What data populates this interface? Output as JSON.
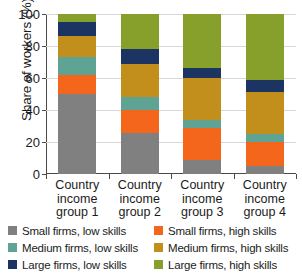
{
  "chart_data": {
    "type": "bar",
    "stacked": true,
    "title": "",
    "xlabel": "",
    "ylabel": "Share of workers (%)",
    "ylim": [
      0,
      100
    ],
    "yticks": [
      0,
      20,
      40,
      60,
      80,
      100
    ],
    "ytick_labels": [
      "0",
      "20",
      "40",
      "60",
      "80",
      "100"
    ],
    "grid": true,
    "legend_position": "bottom",
    "categories": [
      "Country income group 1",
      "Country income group 2",
      "Country income group 3",
      "Country income group 4"
    ],
    "category_lines": [
      [
        "Country",
        "income",
        "group 1"
      ],
      [
        "Country",
        "income",
        "group 2"
      ],
      [
        "Country",
        "income",
        "group 3"
      ],
      [
        "Country",
        "income",
        "group 4"
      ]
    ],
    "series": [
      {
        "name": "Small firms, low skills",
        "color": "#808080",
        "values": [
          50,
          25.5,
          9,
          5
        ]
      },
      {
        "name": "Small firms, high skills",
        "color": "#f4661b",
        "values": [
          12,
          14.5,
          20,
          15
        ]
      },
      {
        "name": "Medium firms, low skills",
        "color": "#5ea394",
        "values": [
          11,
          8,
          5,
          5
        ]
      },
      {
        "name": "Medium firms, high skills",
        "color": "#c28f1d",
        "values": [
          13,
          21,
          26,
          26
        ]
      },
      {
        "name": "Large firms, low skills",
        "color": "#1c3461",
        "values": [
          9,
          9,
          6.5,
          7.5
        ]
      },
      {
        "name": "Large firms, high skills",
        "color": "#87a02b",
        "values": [
          5,
          22,
          33.5,
          41.5
        ]
      }
    ]
  },
  "legend": {
    "items": [
      {
        "label": "Small firms, low skills",
        "color": "#808080"
      },
      {
        "label": "Small firms, high skills",
        "color": "#f4661b"
      },
      {
        "label": "Medium firms, low skills",
        "color": "#5ea394"
      },
      {
        "label": "Medium firms, high skills",
        "color": "#c28f1d"
      },
      {
        "label": "Large firms, low skills",
        "color": "#1c3461"
      },
      {
        "label": "Large firms, high skills",
        "color": "#87a02b"
      }
    ]
  },
  "axis": {
    "y_title": "Share of workers (%)",
    "axis_color": "#4a4a4a",
    "grid_color": "#d8d8d8"
  }
}
